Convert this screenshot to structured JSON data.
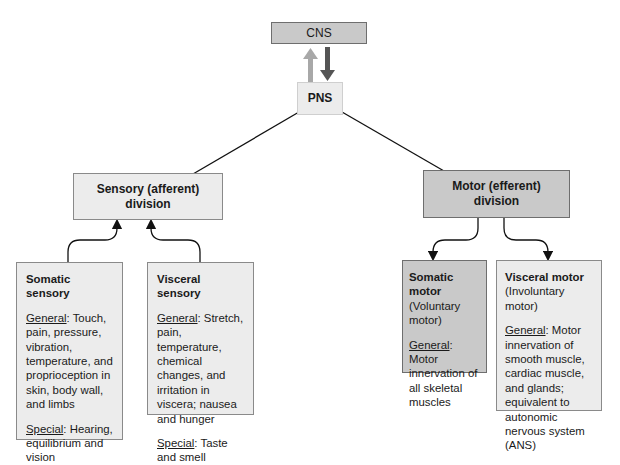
{
  "diagram": {
    "cns": {
      "label": "CNS"
    },
    "pns": {
      "label": "PNS"
    },
    "sensory_division": {
      "line1": "Sensory (afferent)",
      "line2": "division"
    },
    "motor_division": {
      "line1": "Motor (efferent)",
      "line2": "division"
    },
    "somatic_sensory": {
      "title": "Somatic sensory",
      "general_label": "General",
      "general_text": ": Touch, pain, pressure, vibration, temperature, and proprioception in skin, body wall, and limbs",
      "special_label": "Special",
      "special_text": ": Hearing, equilibrium and vision"
    },
    "visceral_sensory": {
      "title": "Visceral sensory",
      "general_label": "General",
      "general_text": ": Stretch, pain, temperature, chemical changes, and irritation in viscera; nausea and hunger",
      "special_label": "Special",
      "special_text": ": Taste and smell"
    },
    "somatic_motor": {
      "title": "Somatic motor",
      "subtitle": "(Voluntary motor)",
      "general_label": "General",
      "general_text": ": Motor innervation of all skeletal muscles"
    },
    "visceral_motor": {
      "title": "Visceral motor",
      "subtitle": "(Involuntary motor)",
      "general_label": "General",
      "general_text": ": Motor innervation of smooth muscle, cardiac muscle, and glands; equivalent to autonomic nervous system (ANS)"
    },
    "colors": {
      "light_box": "#ececec",
      "dark_box": "#c9c9c9",
      "afferent_arrow": "#a8a8a8",
      "efferent_arrow": "#555555"
    }
  }
}
